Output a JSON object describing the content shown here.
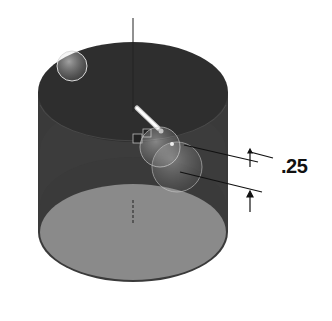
{
  "viewport": {
    "type": "3d-cad-model-view",
    "model": "cylinder"
  },
  "dimension": {
    "value_label": ".25"
  },
  "colors": {
    "background": "#ffffff",
    "cylinder_top": "#2e2e2e",
    "cylinder_side": "#3a3a3a",
    "cylinder_bottom_face": "#8a8a8a",
    "axis_line": "#222222",
    "dimension_lines": "#111111"
  },
  "icons": [
    {
      "name": "drag-handle-icon"
    },
    {
      "name": "relation-badge-icon"
    },
    {
      "name": "relation-badge-icon"
    },
    {
      "name": "sphere-handle-icon"
    },
    {
      "name": "sphere-handle-icon"
    },
    {
      "name": "sphere-handle-icon"
    }
  ]
}
